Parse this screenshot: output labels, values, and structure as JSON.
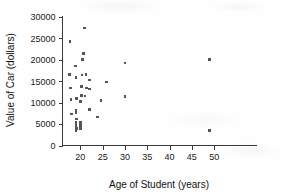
{
  "chart_data": {
    "type": "scatter",
    "title": "",
    "xlabel": "Age of Student (years)",
    "ylabel": "Value of Car (dollars)",
    "xlim": [
      16,
      51
    ],
    "ylim": [
      0,
      30000
    ],
    "xticks": [
      20,
      25,
      30,
      35,
      40,
      45,
      50
    ],
    "xtick_labels": [
      "20",
      "25",
      "30",
      "35",
      "40",
      "45",
      "50"
    ],
    "yticks": [
      0,
      5000,
      10000,
      15000,
      20000,
      25000,
      30000
    ],
    "ytick_labels": [
      "0",
      "5000",
      "10000",
      "15000",
      "20000",
      "25000",
      "30000"
    ],
    "grid": false,
    "legend": false,
    "marker_color": "#555555",
    "marker_shape": "square",
    "points": [
      [
        17.6,
        16500
      ],
      [
        17.7,
        24200
      ],
      [
        17.8,
        13400
      ],
      [
        17.9,
        10700
      ],
      [
        18.0,
        7300
      ],
      [
        18.9,
        18500
      ],
      [
        19.0,
        15900
      ],
      [
        19.1,
        11000
      ],
      [
        19.0,
        8300
      ],
      [
        19.0,
        7700
      ],
      [
        19.1,
        6200
      ],
      [
        19.0,
        5300
      ],
      [
        19.0,
        4600
      ],
      [
        19.1,
        4000
      ],
      [
        19.0,
        3400
      ],
      [
        20.5,
        20100
      ],
      [
        20.4,
        16400
      ],
      [
        20.3,
        13800
      ],
      [
        20.2,
        11600
      ],
      [
        20.1,
        10400
      ],
      [
        20.0,
        10100
      ],
      [
        20.0,
        5500
      ],
      [
        20.0,
        5000
      ],
      [
        20.1,
        4700
      ],
      [
        20.0,
        4300
      ],
      [
        20.1,
        4000
      ],
      [
        20.9,
        27400
      ],
      [
        20.7,
        21500
      ],
      [
        21.3,
        16500
      ],
      [
        21.4,
        13400
      ],
      [
        21.0,
        11500
      ],
      [
        22.0,
        15300
      ],
      [
        22.1,
        13200
      ],
      [
        22.0,
        8400
      ],
      [
        23.9,
        6600
      ],
      [
        24.6,
        10500
      ],
      [
        25.8,
        14800
      ],
      [
        30.0,
        19200
      ],
      [
        30.0,
        11400
      ],
      [
        49.0,
        20100
      ],
      [
        49.0,
        3500
      ]
    ]
  },
  "axes": {
    "x_axis_name": "x-axis",
    "y_axis_name": "y-axis"
  }
}
